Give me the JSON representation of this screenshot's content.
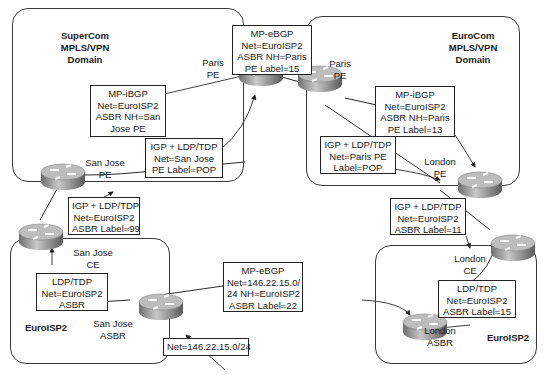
{
  "domains": {
    "supercom": {
      "title": [
        "SuperCom",
        "MPLS/VPN",
        "Domain"
      ]
    },
    "eurocom": {
      "title": [
        "EuroCom",
        "MPLS/VPN",
        "Domain"
      ]
    },
    "euroisp2_left": {
      "title": "EuroISP2"
    },
    "euroisp2_right": {
      "title": "EuroISP2"
    }
  },
  "routers": {
    "paris_pe_supercom": {
      "label": [
        "Paris",
        "PE"
      ]
    },
    "paris_pe_eurocom": {
      "label": [
        "Paris",
        "PE"
      ]
    },
    "san_jose_pe": {
      "label": [
        "San Jose",
        "PE"
      ]
    },
    "san_jose_ce": {
      "label": [
        "San Jose",
        "CE"
      ]
    },
    "san_jose_asbr": {
      "label": [
        "San Jose",
        "ASBR"
      ]
    },
    "london_pe": {
      "label": [
        "London",
        "PE"
      ]
    },
    "london_ce": {
      "label": [
        "London",
        "CE"
      ]
    },
    "london_asbr": {
      "label": [
        "London",
        "ASBR"
      ]
    }
  },
  "boxes": {
    "mp_ebgp_top": [
      "MP-eBGP",
      "Net=EuroISP2",
      "ASBR  NH=Paris",
      "PE  Label=15"
    ],
    "mp_ibgp_supercom": [
      "MP-iBGP",
      "Net=EuroISP2",
      "ASBR  NH=San",
      "Jose  PE"
    ],
    "igp_supercom": [
      "IGP  +  LDP/TDP",
      "Net=San  Jose",
      "PE  Label=POP"
    ],
    "mp_ibgp_eurocom": [
      "MP-iBGP",
      "Net=EuroISP2",
      "ASBR  NH=Paris",
      "PE  Label=13"
    ],
    "igp_eurocom": [
      "IGP  +  LDP/TDP",
      "Net=Paris  PE",
      "Label=POP"
    ],
    "igp_sanjose_ce": [
      "IGP  +  LDP/TDP",
      "Net=EuroISP2",
      "ASBR  Label=99"
    ],
    "igp_london_ce": [
      "IGP  +  LDP/TDP",
      "Net=EuroISP2",
      "ASBR  Label=11"
    ],
    "ldp_left": [
      "LDP/TDP",
      "Net=EuroISP2",
      "ASBR"
    ],
    "ldp_right": [
      "LDP/TDP",
      "Net=EuroISP2",
      "ASBR  Label=15"
    ],
    "mp_ebgp_bottom": [
      "MP-eBGP",
      "Net=146.22.15.0/",
      "24  NH=EuroISP2",
      "ASBR  Label=22"
    ],
    "net_prefix": [
      "Net=146.22.15.0/24"
    ]
  },
  "colors": {
    "line": "#2a2a2a",
    "router_top": "#d8d8d8",
    "router_side": "#8a8a8a"
  }
}
